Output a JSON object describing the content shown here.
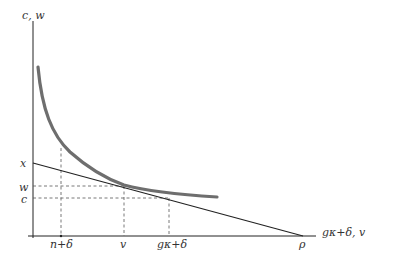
{
  "figure": {
    "y_axis_label": "c, w",
    "x_axis_label": "gκ+δ, v",
    "y_ticks": [
      {
        "label": "x",
        "y": 164
      },
      {
        "label": "w",
        "y": 188
      },
      {
        "label": "c",
        "y": 200
      }
    ],
    "x_ticks": [
      {
        "label": "n+δ",
        "x": 62
      },
      {
        "label": "v",
        "x": 124
      },
      {
        "label": "gκ+δ",
        "x": 170
      },
      {
        "label": "ρ",
        "x": 303
      }
    ],
    "colors": {
      "axis": "#222222",
      "curve": "#6e6e6e",
      "line": "#222222",
      "dashed": "#555555",
      "text": "#333333"
    }
  }
}
